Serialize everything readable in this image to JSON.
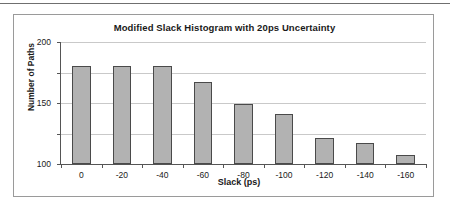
{
  "chart_data": {
    "type": "bar",
    "title": "Modified Slack Histogram with 20ps Uncertainty",
    "xlabel": "Slack (ps)",
    "ylabel": "Number of Paths",
    "categories": [
      "0",
      "-20",
      "-40",
      "-60",
      "-80",
      "-100",
      "-120",
      "-140",
      "-160"
    ],
    "values": [
      161,
      161,
      161,
      135,
      98,
      82,
      42,
      34,
      15
    ],
    "ylim": [
      0,
      200
    ],
    "yticks": [
      0,
      50,
      100,
      150,
      200
    ],
    "ytick_labels": [
      "0",
      "50",
      "100",
      "150",
      "200"
    ],
    "grid": true,
    "legend": false,
    "bar_color": "#b2b2b2",
    "bar_edge_color": "#4a4a4a",
    "gridline_color": "#c9c9c9",
    "axis_color": "#555555",
    "frame_color": "#9a9a9a",
    "text_color": "#1a1a1a"
  }
}
